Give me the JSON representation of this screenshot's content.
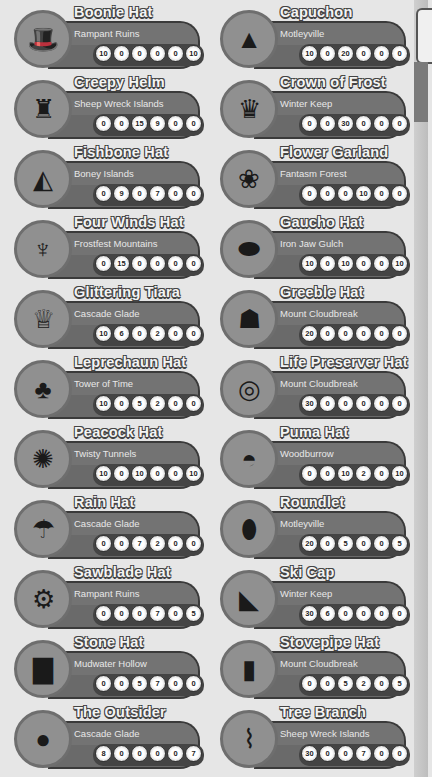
{
  "hats": [
    {
      "name": "Boonie Hat",
      "location": "Rampant Ruins",
      "stats": [
        "10",
        "0",
        "0",
        "0",
        "0",
        "10"
      ],
      "icon": "boonie-hat-icon",
      "glyph": "🎩"
    },
    {
      "name": "Capuchon",
      "location": "Motleyville",
      "stats": [
        "10",
        "0",
        "20",
        "0",
        "0",
        "0"
      ],
      "icon": "capuchon-icon",
      "glyph": "▲"
    },
    {
      "name": "Creepy Helm",
      "location": "Sheep Wreck Islands",
      "stats": [
        "0",
        "0",
        "15",
        "9",
        "0",
        "0"
      ],
      "icon": "creepy-helm-icon",
      "glyph": "♜"
    },
    {
      "name": "Crown of Frost",
      "location": "Winter Keep",
      "stats": [
        "0",
        "0",
        "30",
        "0",
        "0",
        "0"
      ],
      "icon": "crown-of-frost-icon",
      "glyph": "♛"
    },
    {
      "name": "Fishbone Hat",
      "location": "Boney Islands",
      "stats": [
        "0",
        "9",
        "0",
        "7",
        "0",
        "0"
      ],
      "icon": "fishbone-hat-icon",
      "glyph": "◭"
    },
    {
      "name": "Flower Garland",
      "location": "Fantasm Forest",
      "stats": [
        "0",
        "0",
        "0",
        "10",
        "0",
        "0"
      ],
      "icon": "flower-garland-icon",
      "glyph": "❀"
    },
    {
      "name": "Four Winds Hat",
      "location": "Frostfest Mountains",
      "stats": [
        "0",
        "15",
        "0",
        "0",
        "0",
        "0"
      ],
      "icon": "four-winds-hat-icon",
      "glyph": "♆"
    },
    {
      "name": "Gaucho Hat",
      "location": "Iron Jaw Gulch",
      "stats": [
        "10",
        "0",
        "10",
        "0",
        "0",
        "10"
      ],
      "icon": "gaucho-hat-icon",
      "glyph": "⬬"
    },
    {
      "name": "Glittering Tiara",
      "location": "Cascade Glade",
      "stats": [
        "10",
        "6",
        "0",
        "2",
        "0",
        "0"
      ],
      "icon": "glittering-tiara-icon",
      "glyph": "♕"
    },
    {
      "name": "Greeble Hat",
      "location": "Mount Cloudbreak",
      "stats": [
        "20",
        "0",
        "0",
        "0",
        "0",
        "0"
      ],
      "icon": "greeble-hat-icon",
      "glyph": "☗"
    },
    {
      "name": "Leprechaun Hat",
      "location": "Tower of Time",
      "stats": [
        "10",
        "0",
        "5",
        "2",
        "0",
        "0"
      ],
      "icon": "leprechaun-hat-icon",
      "glyph": "♣"
    },
    {
      "name": "Life Preserver Hat",
      "location": "Mount Cloudbreak",
      "stats": [
        "30",
        "0",
        "0",
        "0",
        "0",
        "0"
      ],
      "icon": "life-preserver-hat-icon",
      "glyph": "◎"
    },
    {
      "name": "Peacock Hat",
      "location": "Twisty Tunnels",
      "stats": [
        "10",
        "0",
        "10",
        "0",
        "0",
        "10"
      ],
      "icon": "peacock-hat-icon",
      "glyph": "✺"
    },
    {
      "name": "Puma Hat",
      "location": "Woodburrow",
      "stats": [
        "0",
        "0",
        "10",
        "2",
        "0",
        "10"
      ],
      "icon": "puma-hat-icon",
      "glyph": "◓"
    },
    {
      "name": "Rain Hat",
      "location": "Cascade Glade",
      "stats": [
        "0",
        "0",
        "7",
        "2",
        "0",
        "0"
      ],
      "icon": "rain-hat-icon",
      "glyph": "☂"
    },
    {
      "name": "Roundlet",
      "location": "Motleyville",
      "stats": [
        "20",
        "0",
        "5",
        "0",
        "0",
        "5"
      ],
      "icon": "roundlet-icon",
      "glyph": "⬮"
    },
    {
      "name": "Sawblade Hat",
      "location": "Rampant Ruins",
      "stats": [
        "0",
        "0",
        "0",
        "7",
        "0",
        "5"
      ],
      "icon": "sawblade-hat-icon",
      "glyph": "⚙"
    },
    {
      "name": "Ski Cap",
      "location": "Winter Keep",
      "stats": [
        "30",
        "6",
        "0",
        "0",
        "0",
        "0"
      ],
      "icon": "ski-cap-icon",
      "glyph": "◣"
    },
    {
      "name": "Stone Hat",
      "location": "Mudwater Hollow",
      "stats": [
        "0",
        "0",
        "5",
        "7",
        "0",
        "0"
      ],
      "icon": "stone-hat-icon",
      "glyph": "▇"
    },
    {
      "name": "Stovepipe Hat",
      "location": "Mount Cloudbreak",
      "stats": [
        "0",
        "0",
        "5",
        "2",
        "0",
        "5"
      ],
      "icon": "stovepipe-hat-icon",
      "glyph": "▮"
    },
    {
      "name": "The Outsider",
      "location": "Cascade Glade",
      "stats": [
        "8",
        "0",
        "0",
        "0",
        "0",
        "7"
      ],
      "icon": "the-outsider-icon",
      "glyph": "●"
    },
    {
      "name": "Tree Branch",
      "location": "Sheep Wreck Islands",
      "stats": [
        "30",
        "0",
        "0",
        "7",
        "0",
        "0"
      ],
      "icon": "tree-branch-icon",
      "glyph": "⌇"
    }
  ]
}
